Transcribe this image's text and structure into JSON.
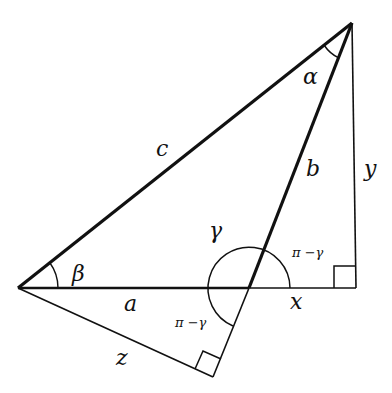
{
  "diagram": {
    "colors": {
      "stroke": "#111111",
      "background": "#ffffff"
    },
    "points": {
      "top": [
        352,
        23
      ],
      "left": [
        18,
        288
      ],
      "gamma_vertex": [
        249,
        288
      ],
      "right_foot": [
        356,
        288
      ],
      "bottom_foot": [
        213,
        377
      ]
    },
    "labels": {
      "alpha": "α",
      "beta": "β",
      "gamma": "γ",
      "pi_minus_gamma_upper": "π −γ",
      "pi_minus_gamma_lower": "π −γ",
      "side_a": "a",
      "side_b": "b",
      "side_c": "c",
      "leg_x": "x",
      "leg_y": "y",
      "leg_z": "z"
    },
    "right_angles": [
      "right_foot",
      "bottom_foot"
    ]
  }
}
